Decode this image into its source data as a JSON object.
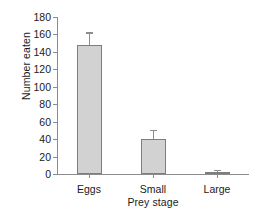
{
  "chart_data": {
    "type": "bar",
    "title": "",
    "subtitle": "",
    "xlabel": "Prey stage",
    "ylabel": "Number eaten",
    "categories": [
      "Eggs",
      "Small",
      "Large"
    ],
    "values": [
      148,
      40,
      1.5
    ],
    "errors": [
      13,
      9,
      1
    ],
    "yticks": [
      0,
      20,
      40,
      60,
      80,
      100,
      120,
      140,
      160,
      180
    ],
    "ytick_labels": [
      "0",
      "20",
      "40",
      "60",
      "80",
      "100",
      "120",
      "140",
      "160",
      "180"
    ],
    "ylim": [
      0,
      180
    ],
    "grid": false,
    "legend": null,
    "annotations": [],
    "bar_fill_color": "#d2d2d2",
    "bar_edge_color": "#7d7d7d",
    "axis_color": "#8c8c8c",
    "error_bar_color": "#8c8c8c",
    "background_color": "#ffffff"
  }
}
